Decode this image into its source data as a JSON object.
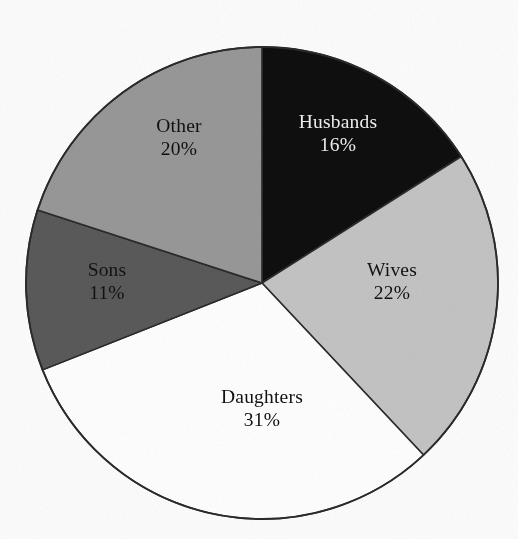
{
  "chart_data": {
    "type": "pie",
    "title": "",
    "subtitle": "",
    "xlabel": "",
    "ylabel": "",
    "legend_position": "none",
    "labels_inside_slices": true,
    "start_angle_deg": 0,
    "direction": "clockwise",
    "units": "percent",
    "categories": [
      "Husbands",
      "Wives",
      "Daughters",
      "Sons",
      "Other"
    ],
    "values": [
      16,
      22,
      31,
      11,
      20
    ],
    "value_labels": [
      "16%",
      "22%",
      "31%",
      "11%",
      "20%"
    ],
    "slice_colors": [
      "#0f0f0f",
      "#c4c4c4",
      "#ffffff",
      "#5a5a5a",
      "#989898"
    ],
    "slice_text_colors": [
      "#efefef",
      "#111111",
      "#111111",
      "#121212",
      "#101010"
    ],
    "outline_color": "#2b2b2b",
    "slices": [
      {
        "name": "Husbands",
        "value": 16,
        "value_label": "16%",
        "color": "#0f0f0f",
        "text_color": "#efefef",
        "start_deg": 0.0,
        "end_deg": 57.6
      },
      {
        "name": "Wives",
        "value": 22,
        "value_label": "22%",
        "color": "#c4c4c4",
        "text_color": "#111111",
        "start_deg": 57.6,
        "end_deg": 136.8
      },
      {
        "name": "Daughters",
        "value": 31,
        "value_label": "31%",
        "color": "#ffffff",
        "text_color": "#111111",
        "start_deg": 136.8,
        "end_deg": 248.4
      },
      {
        "name": "Sons",
        "value": 11,
        "value_label": "11%",
        "color": "#5a5a5a",
        "text_color": "#121212",
        "start_deg": 248.4,
        "end_deg": 288.0
      },
      {
        "name": "Other",
        "value": 20,
        "value_label": "20%",
        "color": "#989898",
        "text_color": "#101010",
        "start_deg": 288.0,
        "end_deg": 360.0
      }
    ]
  },
  "geometry": {
    "center_x": 262,
    "center_y": 283,
    "radius": 236
  }
}
